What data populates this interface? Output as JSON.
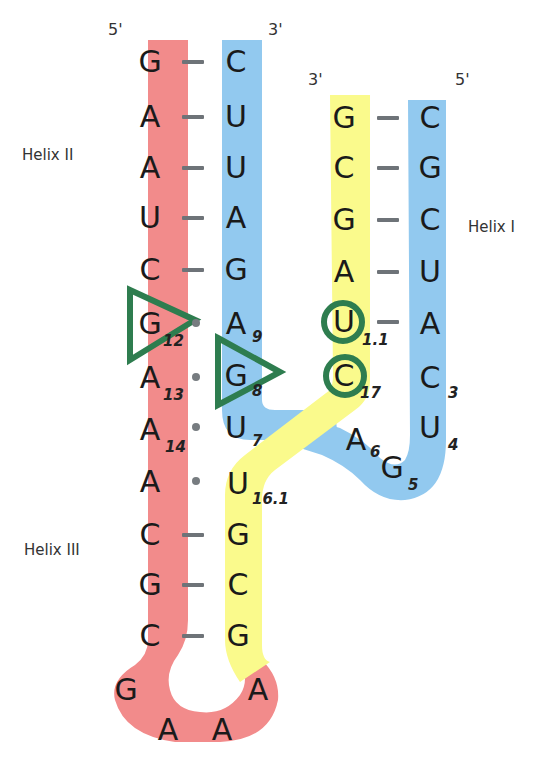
{
  "colors": {
    "strand_red": "#f28b8b",
    "strand_blue": "#92c9ef",
    "strand_yellow": "#fafa8c",
    "marker_green": "#2e7d4f",
    "bond_gray": "#6e7378",
    "text": "#1a1a1a"
  },
  "labels": {
    "helix_1": "Helix I",
    "helix_2": "Helix II",
    "helix_3": "Helix III"
  },
  "ends": {
    "left_5": "5'",
    "left_3": "3'",
    "right_3": "3'",
    "right_5": "5'"
  },
  "red_strand": [
    {
      "base": "G",
      "index": ""
    },
    {
      "base": "A",
      "index": ""
    },
    {
      "base": "A",
      "index": ""
    },
    {
      "base": "U",
      "index": ""
    },
    {
      "base": "C",
      "index": ""
    },
    {
      "base": "G",
      "index": "12"
    },
    {
      "base": "A",
      "index": "13"
    },
    {
      "base": "A",
      "index": "14"
    },
    {
      "base": "A",
      "index": ""
    },
    {
      "base": "C",
      "index": ""
    },
    {
      "base": "G",
      "index": ""
    },
    {
      "base": "C",
      "index": ""
    }
  ],
  "loop": [
    "G",
    "A",
    "A",
    "A"
  ],
  "blue_left_strand": [
    {
      "base": "C",
      "index": ""
    },
    {
      "base": "U",
      "index": ""
    },
    {
      "base": "U",
      "index": ""
    },
    {
      "base": "A",
      "index": ""
    },
    {
      "base": "G",
      "index": ""
    },
    {
      "base": "A",
      "index": "9"
    },
    {
      "base": "G",
      "index": "8"
    },
    {
      "base": "U",
      "index": "7"
    }
  ],
  "yellow_lower_strand": [
    {
      "base": "U",
      "index": "16.1"
    },
    {
      "base": "G",
      "index": ""
    },
    {
      "base": "C",
      "index": ""
    },
    {
      "base": "G",
      "index": ""
    }
  ],
  "yellow_upper_strand": [
    {
      "base": "G",
      "index": ""
    },
    {
      "base": "C",
      "index": ""
    },
    {
      "base": "G",
      "index": ""
    },
    {
      "base": "A",
      "index": ""
    },
    {
      "base": "U",
      "index": "1.1"
    },
    {
      "base": "C",
      "index": "17"
    }
  ],
  "blue_right_strand": [
    {
      "base": "C",
      "index": ""
    },
    {
      "base": "G",
      "index": ""
    },
    {
      "base": "C",
      "index": ""
    },
    {
      "base": "U",
      "index": ""
    },
    {
      "base": "A",
      "index": ""
    },
    {
      "base": "C",
      "index": "3"
    },
    {
      "base": "U",
      "index": "4"
    }
  ],
  "blue_linker": [
    {
      "base": "A",
      "index": "6"
    },
    {
      "base": "G",
      "index": "5"
    }
  ],
  "markers": {
    "triangles": [
      "G12",
      "G8"
    ],
    "circles": [
      "U1.1",
      "C17"
    ]
  }
}
